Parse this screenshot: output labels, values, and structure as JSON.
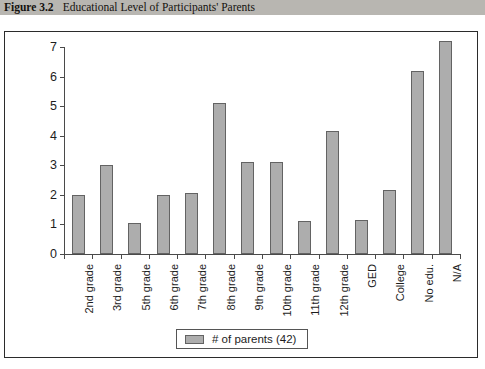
{
  "caption": {
    "figure_number": "Figure 3.2",
    "title": "Educational Level of Participants' Parents"
  },
  "chart_data": {
    "type": "bar",
    "title": "Educational Level of Participants' Parents",
    "xlabel": "",
    "ylabel": "",
    "ylim": [
      0,
      7
    ],
    "yticks": [
      "0",
      "1",
      "2",
      "3",
      "4",
      "5",
      "6",
      "7"
    ],
    "grid": false,
    "legend_position": "bottom-center",
    "categories": [
      "2nd grade",
      "3rd grade",
      "5th grade",
      "6th grade",
      "7th grade",
      "8th grade",
      "9th grade",
      "10th grade",
      "11th grade",
      "12th grade",
      "GED",
      "College",
      "No edu.",
      "N/A"
    ],
    "series": [
      {
        "name": "# of parents (42)",
        "color": "#adadad",
        "values": [
          2,
          3,
          1.05,
          2,
          2.05,
          5.1,
          3.1,
          3.1,
          1.1,
          4.15,
          1.15,
          2.15,
          6.2,
          7.2
        ]
      }
    ],
    "legend": [
      "# of parents (42)"
    ]
  }
}
